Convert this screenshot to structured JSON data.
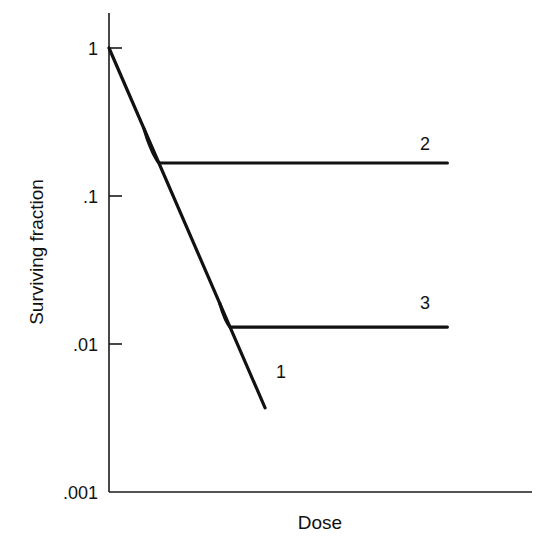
{
  "chart_data": {
    "type": "line",
    "title": "",
    "xlabel": "Dose",
    "ylabel": "Surviving fraction",
    "yscale": "log",
    "ylim": [
      0.001,
      1.6
    ],
    "xlim": [
      0,
      10
    ],
    "xunits": "arbitrary (no x tick labels shown)",
    "yticks": [
      {
        "value": 1,
        "label": "1"
      },
      {
        "value": 0.1,
        "label": ".1"
      },
      {
        "value": 0.01,
        "label": ".01"
      },
      {
        "value": 0.001,
        "label": ".001"
      }
    ],
    "grid": false,
    "legend": "none (curves labeled inline)",
    "series": [
      {
        "name": "1",
        "label": "1",
        "description": "Exponential (straight line on log scale) survival",
        "shape": "exponential",
        "start": {
          "x": 0,
          "y": 1
        },
        "end": {
          "x": 3.69,
          "y": 0.0037
        }
      },
      {
        "name": "2",
        "label": "2",
        "description": "Follows curve 1 then levels off to a resistant plateau",
        "shape": "exponential-then-plateau",
        "branch": {
          "x": 0.83,
          "y": 0.29
        },
        "plateau": 0.167,
        "plateau_start_x": 2.5,
        "end_x": 8.0
      },
      {
        "name": "3",
        "label": "3",
        "description": "Follows curve 1 then levels off to a lower plateau",
        "shape": "exponential-then-plateau",
        "branch": {
          "x": 2.62,
          "y": 0.0195
        },
        "plateau": 0.013,
        "plateau_start_x": 3.7,
        "end_x": 8.0
      }
    ]
  }
}
